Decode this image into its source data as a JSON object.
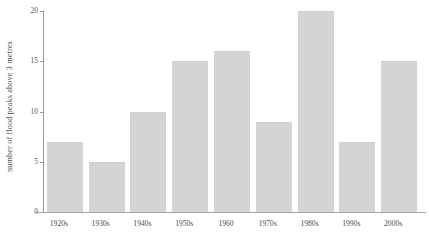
{
  "chart_data": {
    "type": "bar",
    "title": "",
    "subtitle": "",
    "xlabel": "",
    "ylabel": "number of flood peaks above 3 metres",
    "categories": [
      "1920s",
      "1930s",
      "1940s",
      "1950s",
      "1960",
      "1970s",
      "1980s",
      "1990s",
      "2000s"
    ],
    "values": [
      7,
      5,
      10,
      15,
      16,
      9,
      20,
      7,
      15
    ],
    "ylim": [
      0,
      20
    ],
    "yticks": [
      0,
      5,
      10,
      15,
      20
    ],
    "ytick_labels": [
      "0",
      "5",
      "10",
      "15",
      "20"
    ],
    "grid": false,
    "legend": null,
    "legend_position": "none",
    "bar_color": "#d4d4d2",
    "axis_color": "#9a9a96",
    "text_color": "#4c4c47",
    "background": "#ffffff"
  }
}
